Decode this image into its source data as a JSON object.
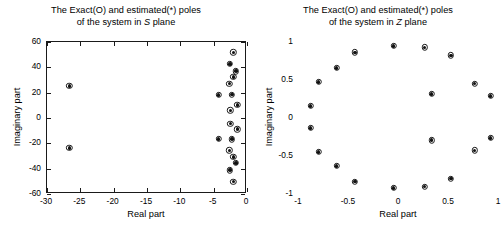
{
  "figure": {
    "width": 504,
    "height": 251,
    "background": "#ffffff",
    "marker_color": "#1a1a1a"
  },
  "panels": [
    {
      "id": "s-plane",
      "title_line1": "The Exact(O) and estimated(*) poles",
      "title_line2_pre": "of the system in ",
      "title_line2_ital": "S",
      "title_line2_post": " plane",
      "xlabel": "Real part",
      "ylabel": "Imaginary part",
      "xticks": [
        "-30",
        "-25",
        "-20",
        "-15",
        "-10",
        "-5",
        "0"
      ],
      "yticks": [
        "60",
        "40",
        "20",
        "0",
        "-20",
        "-40",
        "-60"
      ]
    },
    {
      "id": "z-plane",
      "title_line1": "The Exact(O) and estimated(*) poles",
      "title_line2_pre": "of the system in ",
      "title_line2_ital": "Z",
      "title_line2_post": " plane",
      "xlabel": "Real part",
      "ylabel": "Imaginary part",
      "xticks": [
        "-1",
        "-0.5",
        "0",
        "0.5",
        "1"
      ],
      "yticks": [
        "1",
        "0.5",
        "0",
        "-0.5",
        "-1"
      ]
    }
  ],
  "chart_data": [
    {
      "type": "scatter",
      "id": "s-plane",
      "title": "The Exact(O) and estimated(*) poles of the system in S plane",
      "xlabel": "Real part",
      "ylabel": "Imaginary part",
      "xlim": [
        -30,
        0
      ],
      "ylim": [
        -60,
        60
      ],
      "xticks": [
        -30,
        -25,
        -20,
        -15,
        -10,
        -5,
        0
      ],
      "yticks": [
        -60,
        -40,
        -20,
        0,
        20,
        40,
        60
      ],
      "grid": false,
      "legend": "none",
      "series": [
        {
          "name": "Exact poles (O)",
          "marker": "o",
          "points": [
            [
              -26.5,
              24.5
            ],
            [
              -26.5,
              -24.5
            ],
            [
              -4.1,
              17.3
            ],
            [
              -4.1,
              -17.3
            ],
            [
              -1.3,
              9.6
            ],
            [
              -1.3,
              -9.6
            ],
            [
              -2.35,
              5.2
            ],
            [
              -2.35,
              -5.2
            ],
            [
              -2.1,
              17.6
            ],
            [
              -2.1,
              -17.6
            ],
            [
              -2.5,
              26.3
            ],
            [
              -2.5,
              -26.3
            ],
            [
              -1.9,
              31.6
            ],
            [
              -1.9,
              -31.6
            ],
            [
              -2.4,
              42.0
            ],
            [
              -2.4,
              -42.0
            ],
            [
              -1.5,
              36.2
            ],
            [
              -1.5,
              -36.2
            ],
            [
              -1.9,
              51.0
            ],
            [
              -1.9,
              -51.0
            ]
          ]
        },
        {
          "name": "Estimated poles (*)",
          "marker": "*",
          "points": [
            [
              -26.5,
              24.5
            ],
            [
              -26.5,
              -24.5
            ],
            [
              -4.1,
              17.3
            ],
            [
              -4.1,
              -17.3
            ],
            [
              -1.3,
              9.6
            ],
            [
              -1.3,
              -9.6
            ],
            [
              -2.35,
              5.2
            ],
            [
              -2.35,
              -5.2
            ],
            [
              -2.1,
              17.6
            ],
            [
              -2.1,
              -17.6
            ],
            [
              -2.5,
              26.3
            ],
            [
              -2.5,
              -26.3
            ],
            [
              -1.9,
              31.6
            ],
            [
              -1.9,
              -31.6
            ],
            [
              -2.4,
              42.0
            ],
            [
              -2.4,
              -42.0
            ],
            [
              -1.5,
              36.2
            ],
            [
              -1.5,
              -36.2
            ],
            [
              -1.9,
              51.0
            ],
            [
              -1.9,
              -51.0
            ]
          ]
        }
      ]
    },
    {
      "type": "scatter",
      "id": "z-plane",
      "title": "The Exact(O) and estimated(*) poles of the system in Z plane",
      "xlabel": "Real part",
      "ylabel": "Imaginary part",
      "xlim": [
        -1,
        1
      ],
      "ylim": [
        -1,
        1
      ],
      "xticks": [
        -1,
        -0.5,
        0,
        0.5,
        1
      ],
      "yticks": [
        -1,
        -0.5,
        0,
        0.5,
        1
      ],
      "grid": false,
      "legend": "none",
      "series": [
        {
          "name": "Exact poles (O)",
          "marker": "o",
          "points": [
            [
              -0.875,
              0.145
            ],
            [
              -0.875,
              -0.145
            ],
            [
              -0.795,
              0.46
            ],
            [
              -0.795,
              -0.46
            ],
            [
              -0.615,
              0.645
            ],
            [
              -0.615,
              -0.645
            ],
            [
              -0.43,
              0.85
            ],
            [
              -0.43,
              -0.85
            ],
            [
              -0.045,
              0.935
            ],
            [
              -0.045,
              -0.935
            ],
            [
              0.265,
              0.915
            ],
            [
              0.265,
              -0.915
            ],
            [
              0.53,
              0.81
            ],
            [
              0.53,
              -0.81
            ],
            [
              0.765,
              0.44
            ],
            [
              0.765,
              -0.44
            ],
            [
              0.925,
              0.275
            ],
            [
              0.925,
              -0.275
            ],
            [
              0.335,
              0.305
            ],
            [
              0.335,
              -0.305
            ]
          ]
        },
        {
          "name": "Estimated poles (*)",
          "marker": "*",
          "points": [
            [
              -0.875,
              0.145
            ],
            [
              -0.875,
              -0.145
            ],
            [
              -0.795,
              0.46
            ],
            [
              -0.795,
              -0.46
            ],
            [
              -0.615,
              0.645
            ],
            [
              -0.615,
              -0.645
            ],
            [
              -0.43,
              0.85
            ],
            [
              -0.43,
              -0.85
            ],
            [
              -0.045,
              0.935
            ],
            [
              -0.045,
              -0.935
            ],
            [
              0.265,
              0.915
            ],
            [
              0.265,
              -0.915
            ],
            [
              0.53,
              0.81
            ],
            [
              0.53,
              -0.81
            ],
            [
              0.765,
              0.44
            ],
            [
              0.765,
              -0.44
            ],
            [
              0.925,
              0.275
            ],
            [
              0.925,
              -0.275
            ],
            [
              0.335,
              0.305
            ],
            [
              0.335,
              -0.305
            ]
          ]
        }
      ]
    }
  ]
}
